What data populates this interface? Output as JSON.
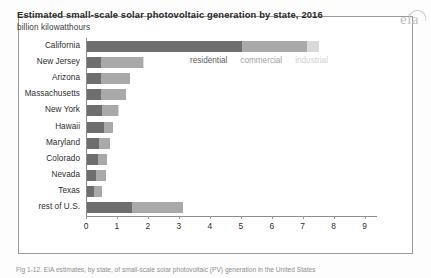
{
  "title": "Estimated small-scale solar photovoltaic generation by state, 2016",
  "subtitle": "billion kilowatthours",
  "logo": "eia",
  "caption": "Fig 1-12. EIA estimates, by state, of small-scale solar photovoltaic (PV) generation in the United States",
  "legend": {
    "residential": "residential",
    "commercial": "commercial",
    "industrial": "industrial"
  },
  "chart_data": {
    "type": "bar",
    "orientation": "horizontal",
    "stacked": true,
    "title": "Estimated small-scale solar photovoltaic generation by state, 2016",
    "subtitle": "billion kilowatthours",
    "xlabel": "",
    "ylabel": "",
    "xlim": [
      0,
      9.4
    ],
    "grid": false,
    "legend_position": "inside-top",
    "xticks": [
      0,
      1,
      2,
      3,
      4,
      5,
      6,
      7,
      8,
      9
    ],
    "xticklabels": [
      "0",
      "1",
      "2",
      "3",
      "4",
      "5",
      "6",
      "7",
      "8",
      "9"
    ],
    "categories": [
      "California",
      "New Jersey",
      "Arizona",
      "Massachusetts",
      "New York",
      "Hawaii",
      "Maryland",
      "Colorado",
      "Nevada",
      "Texas",
      "rest of U.S."
    ],
    "series": [
      {
        "name": "residential",
        "color": "#6e6e6e",
        "values": [
          5.0,
          0.45,
          0.45,
          0.45,
          0.5,
          0.55,
          0.4,
          0.35,
          0.3,
          0.22,
          1.45
        ]
      },
      {
        "name": "commercial",
        "color": "#a9a9a9",
        "values": [
          2.1,
          1.35,
          0.95,
          0.8,
          0.5,
          0.3,
          0.35,
          0.3,
          0.32,
          0.28,
          1.65
        ]
      },
      {
        "name": "industrial",
        "color": "#d9d9d9",
        "values": [
          0.4,
          0.05,
          0.0,
          0.0,
          0.05,
          0.0,
          0.0,
          0.0,
          0.0,
          0.0,
          0.0
        ]
      }
    ],
    "totals": [
      7.5,
      1.85,
      1.4,
      1.25,
      1.05,
      0.85,
      0.75,
      0.65,
      0.62,
      0.5,
      3.1
    ]
  }
}
